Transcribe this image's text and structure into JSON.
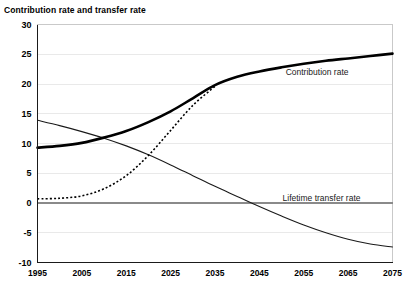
{
  "chart_data": {
    "type": "line",
    "title": "Contribution rate and transfer rate",
    "xlabel": "",
    "ylabel": "",
    "xlim": [
      1995,
      2075
    ],
    "ylim": [
      -10,
      30
    ],
    "grid": true,
    "legend_position": "inline-annotation",
    "x_ticks": [
      "1995",
      "2005",
      "2015",
      "2025",
      "2035",
      "2045",
      "2055",
      "2065",
      "2075"
    ],
    "y_ticks": [
      "30",
      "25",
      "20",
      "15",
      "10",
      "5",
      "0",
      "-5",
      "-10"
    ],
    "annotations": [
      {
        "text": "Contribution rate",
        "x": 2058,
        "y": 21.5
      },
      {
        "text": "Lifetime transfer rate",
        "x": 2059,
        "y": 0.3
      }
    ],
    "series": [
      {
        "name": "Contribution rate",
        "style": "thick-solid",
        "color": "#000000",
        "x": [
          1995,
          2000,
          2005,
          2010,
          2015,
          2020,
          2025,
          2030,
          2035,
          2040,
          2045,
          2050,
          2055,
          2060,
          2065,
          2070,
          2075
        ],
        "values": [
          9.3,
          9.6,
          10.1,
          11.0,
          12.1,
          13.6,
          15.4,
          17.6,
          19.8,
          21.2,
          22.1,
          22.8,
          23.4,
          23.9,
          24.3,
          24.7,
          25.1
        ]
      },
      {
        "name": "Lifetime transfer rate",
        "style": "thin-solid",
        "color": "#1a1a1a",
        "x": [
          1995,
          2000,
          2005,
          2010,
          2015,
          2020,
          2025,
          2030,
          2035,
          2040,
          2045,
          2050,
          2055,
          2060,
          2065,
          2070,
          2075
        ],
        "values": [
          13.9,
          13.0,
          12.0,
          10.9,
          9.6,
          8.1,
          6.4,
          4.6,
          2.8,
          1.1,
          -0.6,
          -2.2,
          -3.7,
          -5.0,
          -6.1,
          -6.9,
          -7.4
        ]
      },
      {
        "name": "Transfer rate (dotted)",
        "style": "dotted",
        "color": "#000000",
        "x": [
          1995,
          2000,
          2005,
          2010,
          2015,
          2020,
          2025,
          2030,
          2035
        ],
        "values": [
          0.7,
          0.8,
          1.2,
          2.4,
          4.6,
          8.0,
          12.2,
          16.4,
          19.6
        ]
      }
    ]
  }
}
